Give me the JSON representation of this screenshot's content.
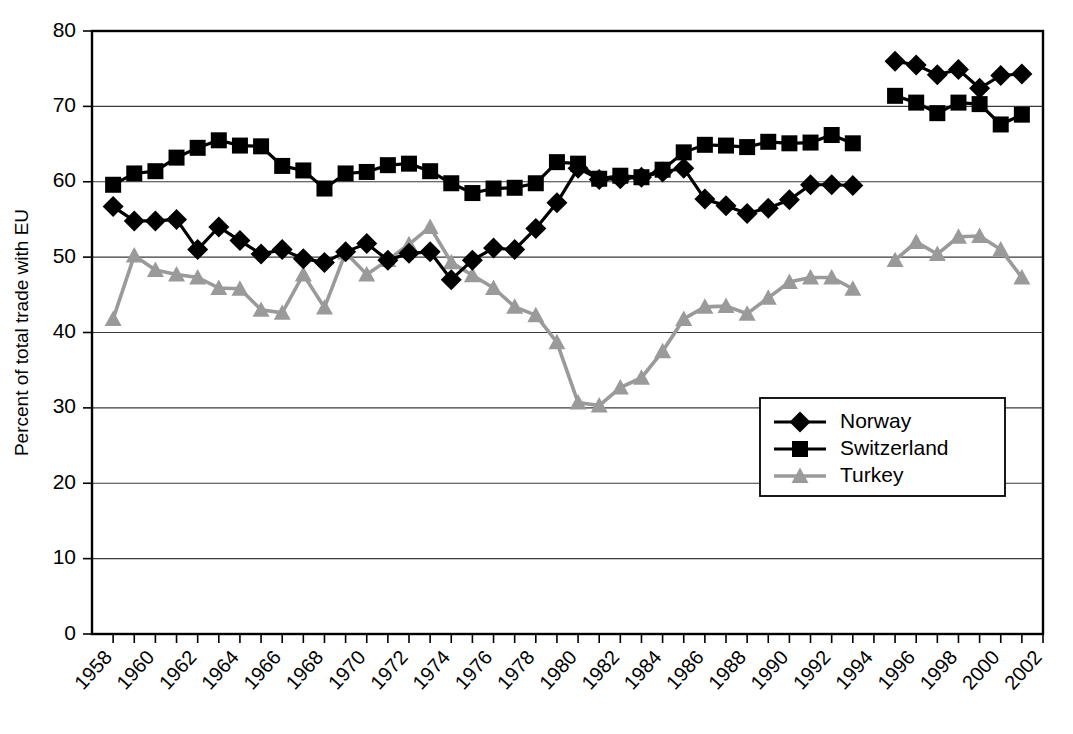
{
  "chart_data": {
    "type": "line",
    "title": "",
    "xlabel": "",
    "ylabel": "Percent of total trade with EU",
    "xlim": [
      1957,
      2002
    ],
    "ylim": [
      0,
      80
    ],
    "grid": true,
    "legend_position": "inside-right",
    "y_ticks": [
      0,
      10,
      20,
      30,
      40,
      50,
      60,
      70,
      80
    ],
    "y_tick_labels": [
      "0",
      "10",
      "20",
      "30",
      "40",
      "50",
      "60",
      "70",
      "80"
    ],
    "x_ticks": [
      1958,
      1960,
      1962,
      1964,
      1966,
      1968,
      1970,
      1972,
      1974,
      1976,
      1978,
      1980,
      1982,
      1984,
      1986,
      1988,
      1990,
      1992,
      1994,
      1996,
      1998,
      2000,
      2002
    ],
    "x_tick_labels": [
      "1958",
      "1960",
      "1962",
      "1964",
      "1966",
      "1968",
      "1970",
      "1972",
      "1974",
      "1976",
      "1978",
      "1980",
      "1982",
      "1984",
      "1986",
      "1988",
      "1990",
      "1992",
      "1994",
      "1996",
      "1998",
      "2000",
      "2002"
    ],
    "series": [
      {
        "name": "Norway",
        "color": "#000000",
        "marker": "diamond",
        "segments": [
          {
            "x": [
              1958,
              1959,
              1960,
              1961,
              1962,
              1963,
              1964,
              1965,
              1966,
              1967,
              1968,
              1969,
              1970,
              1971,
              1972,
              1973,
              1974,
              1975,
              1976,
              1977,
              1978,
              1979,
              1980,
              1981,
              1982,
              1983,
              1984,
              1985,
              1986,
              1987,
              1988,
              1989,
              1990,
              1991,
              1992,
              1993
            ],
            "y": [
              56.7,
              54.8,
              54.8,
              55.0,
              51.0,
              54.0,
              52.2,
              50.4,
              51.0,
              49.8,
              49.3,
              50.7,
              51.8,
              49.6,
              50.5,
              50.7,
              47.0,
              49.6,
              51.2,
              51.0,
              53.8,
              57.2,
              61.8,
              60.3,
              60.4,
              60.6,
              61.3,
              61.8,
              57.7,
              56.8,
              55.8,
              56.5,
              57.6,
              59.6,
              59.6,
              59.5
            ]
          },
          {
            "x": [
              1995,
              1996,
              1997,
              1998,
              1999,
              2000,
              2001
            ],
            "y": [
              76.0,
              75.5,
              74.2,
              74.9,
              72.4,
              74.1,
              74.3
            ]
          }
        ]
      },
      {
        "name": "Switzerland",
        "color": "#000000",
        "marker": "square",
        "segments": [
          {
            "x": [
              1958,
              1959,
              1960,
              1961,
              1962,
              1963,
              1964,
              1965,
              1966,
              1967,
              1968,
              1969,
              1970,
              1971,
              1972,
              1973,
              1974,
              1975,
              1976,
              1977,
              1978,
              1979,
              1980,
              1981,
              1982,
              1983,
              1984,
              1985,
              1986,
              1987,
              1988,
              1989,
              1990,
              1991,
              1992,
              1993
            ],
            "y": [
              59.6,
              61.1,
              61.4,
              63.2,
              64.5,
              65.5,
              64.8,
              64.7,
              62.1,
              61.5,
              59.1,
              61.1,
              61.3,
              62.2,
              62.4,
              61.4,
              59.8,
              58.5,
              59.1,
              59.2,
              59.8,
              62.6,
              62.4,
              60.4,
              60.8,
              60.6,
              61.6,
              63.9,
              64.9,
              64.8,
              64.6,
              65.3,
              65.1,
              65.2,
              66.2,
              65.1
            ]
          },
          {
            "x": [
              1995,
              1996,
              1997,
              1998,
              1999,
              2000,
              2001
            ],
            "y": [
              71.4,
              70.5,
              69.1,
              70.5,
              70.3,
              67.6,
              68.9
            ]
          }
        ]
      },
      {
        "name": "Turkey",
        "color": "#9a9a9a",
        "marker": "triangle",
        "segments": [
          {
            "x": [
              1958,
              1959,
              1960,
              1961,
              1962,
              1963,
              1964,
              1965,
              1966,
              1967,
              1968,
              1969,
              1970,
              1971,
              1972,
              1973,
              1974,
              1975,
              1976,
              1977,
              1978,
              1979,
              1980,
              1981,
              1982,
              1983,
              1984,
              1985,
              1986,
              1987,
              1988,
              1989,
              1990,
              1991,
              1992,
              1993
            ],
            "y": [
              41.8,
              50.2,
              48.3,
              47.7,
              47.3,
              45.9,
              45.8,
              43.0,
              42.6,
              47.7,
              43.3,
              50.6,
              47.7,
              49.6,
              51.7,
              54.0,
              49.3,
              47.6,
              45.9,
              43.4,
              42.3,
              38.7,
              30.7,
              30.3,
              32.7,
              34.0,
              37.5,
              41.8,
              43.4,
              43.5,
              42.5,
              44.6,
              46.7,
              47.3,
              47.3,
              45.8
            ]
          },
          {
            "x": [
              1995,
              1996,
              1997,
              1998,
              1999,
              2000,
              2001
            ],
            "y": [
              49.6,
              52.0,
              50.4,
              52.7,
              52.8,
              51.0,
              47.3
            ]
          }
        ]
      }
    ]
  },
  "legend": {
    "entries": [
      {
        "label": "Norway"
      },
      {
        "label": "Switzerland"
      },
      {
        "label": "Turkey"
      }
    ]
  }
}
